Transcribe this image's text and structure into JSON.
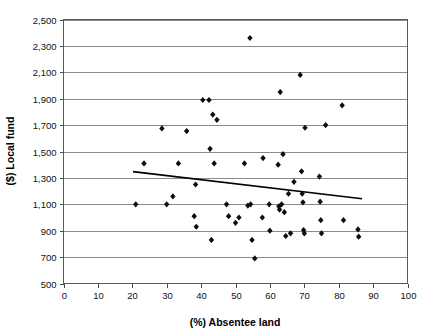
{
  "chart_data": {
    "type": "scatter",
    "title": "",
    "xlabel": "(%) Absentee land",
    "ylabel": "($) Local fund",
    "xlim": [
      0,
      100
    ],
    "ylim": [
      500,
      2500
    ],
    "xticks": [
      0,
      10,
      20,
      30,
      40,
      50,
      60,
      70,
      80,
      90,
      100
    ],
    "yticks": [
      500,
      700,
      900,
      1100,
      1300,
      1500,
      1700,
      1900,
      2100,
      2300,
      2500
    ],
    "xtick_labels": [
      "0",
      "10",
      "20",
      "30",
      "40",
      "50",
      "60",
      "70",
      "80",
      "90",
      "100"
    ],
    "ytick_labels": [
      "500",
      "700",
      "900",
      "1,100",
      "1,300",
      "1,500",
      "1,700",
      "1,900",
      "2,100",
      "2,300",
      "2,500"
    ],
    "grid": "horizontal",
    "legend": "none",
    "marker_color": "#0d0d0d",
    "marker_shape": "diamond",
    "series": [
      {
        "name": "Local fund vs absentee land",
        "points": [
          [
            21.0,
            1100
          ],
          [
            23.4,
            1410
          ],
          [
            28.6,
            1675
          ],
          [
            30.0,
            1100
          ],
          [
            31.8,
            1160
          ],
          [
            33.4,
            1410
          ],
          [
            35.8,
            1655
          ],
          [
            38.0,
            1010
          ],
          [
            38.4,
            1250
          ],
          [
            38.6,
            930
          ],
          [
            40.5,
            1890
          ],
          [
            42.3,
            1890
          ],
          [
            42.6,
            1520
          ],
          [
            43.0,
            830
          ],
          [
            43.4,
            1780
          ],
          [
            43.8,
            1410
          ],
          [
            44.6,
            1740
          ],
          [
            47.4,
            1100
          ],
          [
            48.0,
            1010
          ],
          [
            50.0,
            960
          ],
          [
            51.0,
            1000
          ],
          [
            52.6,
            1410
          ],
          [
            53.6,
            1090
          ],
          [
            54.2,
            2360
          ],
          [
            54.4,
            1100
          ],
          [
            54.8,
            830
          ],
          [
            55.6,
            690
          ],
          [
            57.8,
            1000
          ],
          [
            58.0,
            1450
          ],
          [
            59.8,
            1100
          ],
          [
            60.0,
            900
          ],
          [
            62.4,
            1400
          ],
          [
            62.6,
            1085
          ],
          [
            62.8,
            1060
          ],
          [
            63.0,
            1950
          ],
          [
            63.4,
            1100
          ],
          [
            63.8,
            1480
          ],
          [
            64.2,
            1040
          ],
          [
            64.6,
            860
          ],
          [
            65.4,
            1180
          ],
          [
            66.0,
            880
          ],
          [
            67.0,
            1270
          ],
          [
            68.8,
            2080
          ],
          [
            69.2,
            1350
          ],
          [
            69.4,
            1180
          ],
          [
            69.6,
            1115
          ],
          [
            69.8,
            905
          ],
          [
            70.0,
            880
          ],
          [
            70.2,
            1680
          ],
          [
            74.4,
            1310
          ],
          [
            74.6,
            1120
          ],
          [
            74.8,
            980
          ],
          [
            75.0,
            880
          ],
          [
            76.2,
            1700
          ],
          [
            81.0,
            1850
          ],
          [
            81.4,
            980
          ],
          [
            85.6,
            910
          ],
          [
            85.8,
            855
          ]
        ]
      }
    ],
    "trendline": {
      "type": "linear",
      "x_start": 20.2,
      "y_start": 1348,
      "x_end": 86.8,
      "y_end": 1142
    }
  }
}
